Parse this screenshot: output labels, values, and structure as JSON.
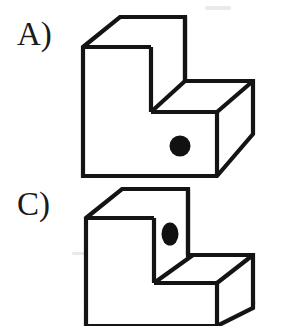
{
  "sheet": {
    "title": "Mental rotation item - block figures",
    "background_color": "#ffffff",
    "ink_color": "#141414",
    "width": 284,
    "height": 326
  },
  "options": [
    {
      "id": "option-a",
      "label": "A)",
      "label_x": 17,
      "label_y": 18,
      "figure_name": "l-shaped-block-a",
      "dot_shape": "circle",
      "dot_face": "front-face",
      "dot_center_x": 180,
      "dot_center_y": 146,
      "dot_radius_x": 10.5,
      "dot_radius_y": 10.5,
      "dot_color": "#111111",
      "outline": "83,47 120,17 185,17 185,81 253,81 253,134 217,176 83,176",
      "faces": {
        "top_face": "83,47 120,17 185,17 151,47",
        "front_tall_face": "83,47 151,47 151,112 217,112 217,176 83,176",
        "step_top_face": "151,112 185,81 253,81 217,112",
        "right_side_face": "217,112 253,81 253,134 217,176"
      },
      "inner_edges": [
        "151,47 151,112",
        "151,112 217,112",
        "151,112 185,81",
        "185,81 185,17",
        "185,81 253,81",
        "217,112 253,81",
        "217,112 217,176",
        "83,47 151,47"
      ]
    },
    {
      "id": "option-c",
      "label": "C)",
      "label_x": 17,
      "label_y": 188,
      "figure_name": "l-shaped-block-c",
      "dot_shape": "ellipse",
      "dot_face": "upper-right-side-face",
      "dot_center_x": 170,
      "dot_center_y": 234,
      "dot_radius_x": 8.5,
      "dot_radius_y": 11.5,
      "dot_color": "#111111",
      "outline": "86,218 122,189 188,189 188,255 253,255 253,308 217,326 86,326",
      "faces": {
        "top_face": "86,218 122,189 188,189 154,218",
        "front_tall_face": "86,218 154,218 154,283 217,283 217,326 86,326",
        "step_top_face": "154,283 193,255 253,255 217,283",
        "right_side_face": "217,283 253,255 253,308 217,326"
      },
      "inner_edges": [
        "154,218 154,283",
        "154,283 217,283",
        "154,283 193,255",
        "188,255 188,189",
        "188,255 253,255",
        "217,283 253,255",
        "217,283 217,326",
        "86,218 154,218"
      ],
      "clipped_at_bottom": true
    }
  ],
  "artifacts": {
    "description": "light scanner specks on white paper",
    "specks": [
      {
        "x": 205,
        "y": 6,
        "w": 26,
        "h": 4
      },
      {
        "x": 95,
        "y": 126,
        "w": 40,
        "h": 3
      },
      {
        "x": 196,
        "y": 92,
        "w": 18,
        "h": 6
      },
      {
        "x": 72,
        "y": 252,
        "w": 16,
        "h": 3
      },
      {
        "x": 236,
        "y": 300,
        "w": 20,
        "h": 5
      },
      {
        "x": 150,
        "y": 318,
        "w": 26,
        "h": 4
      }
    ]
  }
}
